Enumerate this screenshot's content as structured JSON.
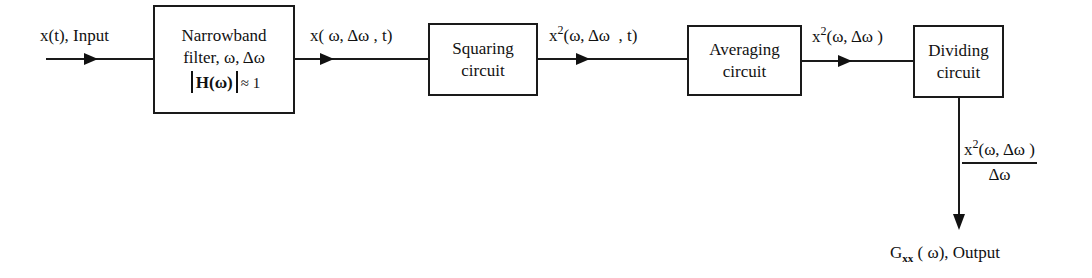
{
  "diagram": {
    "type": "block-diagram",
    "input": {
      "label": "x(t), Input"
    },
    "blocks": [
      {
        "id": "narrowband-filter",
        "line1": "Narrowband",
        "line2": "filter, ω, Δω",
        "line3_prefix": "H(ω)",
        "line3_suffix": "≈ 1"
      },
      {
        "id": "squaring-circuit",
        "line1": "Squaring",
        "line2": "circuit"
      },
      {
        "id": "averaging-circuit",
        "line1": "Averaging",
        "line2": "circuit"
      },
      {
        "id": "dividing-circuit",
        "line1": "Dividing",
        "line2": "circuit"
      }
    ],
    "signals": [
      {
        "id": "filter-out",
        "label": "x( ω, Δω , t)"
      },
      {
        "id": "square-out",
        "base": "x",
        "sup": "2",
        "rest": "(ω, Δω  , t)"
      },
      {
        "id": "average-out",
        "base": "x",
        "sup": "2",
        "rest": "(ω, Δω )"
      }
    ],
    "fraction": {
      "num_base": "x",
      "num_sup": "2",
      "num_rest": "(ω, Δω )",
      "den": "Δω"
    },
    "output": {
      "base": "G",
      "sub": "xx",
      "rest": " ( ω), Output"
    },
    "colors": {
      "line": "#1a1a1a",
      "background": "#ffffff"
    }
  }
}
